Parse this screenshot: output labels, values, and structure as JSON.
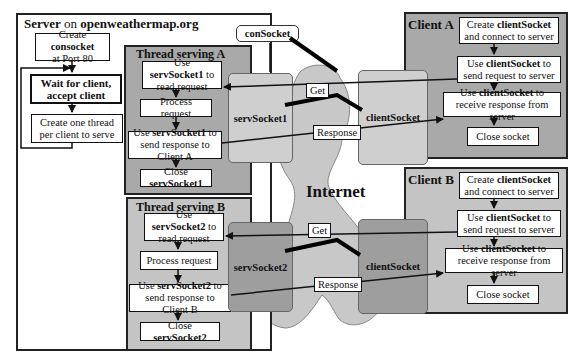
{
  "server": {
    "title_bold1": "Server",
    "title_normal": " on ",
    "title_bold2": "openweathermap.org",
    "steps": [
      {
        "pre": "Create ",
        "bold": "consocket",
        "post": " at Port 80"
      },
      {
        "text": "Wait for client, accept client"
      },
      {
        "text": "Create one thread per client to serve"
      }
    ]
  },
  "thread_a": {
    "title": "Thread serving A",
    "steps": [
      {
        "pre": "Use ",
        "bold": "servSocket1",
        "post": " to read request"
      },
      {
        "text": "Process request"
      },
      {
        "pre": "Use ",
        "bold": "servSocket1",
        "post": " to send response to Client A"
      },
      {
        "pre": "Close ",
        "bold": "servSocket1",
        "post": ""
      }
    ]
  },
  "thread_b": {
    "title": "Thread serving B",
    "steps": [
      {
        "pre": "Use ",
        "bold": "servSocket2",
        "post": " to read request"
      },
      {
        "text": "Process request"
      },
      {
        "pre": "Use ",
        "bold": "servSocket2",
        "post": " to send response to Client B"
      },
      {
        "pre": "Close ",
        "bold": "servSocket2",
        "post": ""
      }
    ]
  },
  "client_a": {
    "title": "Client A",
    "steps": [
      {
        "pre": "Create ",
        "bold": "clientSocket",
        "post": " and connect to server"
      },
      {
        "pre": "Use ",
        "bold": "clientSocket",
        "post": " to send request to server"
      },
      {
        "pre": "Use ",
        "bold": "clientSocket",
        "post": " to receive response from server"
      },
      {
        "text": "Close socket"
      }
    ]
  },
  "client_b": {
    "title": "Client B",
    "steps": [
      {
        "pre": "Create ",
        "bold": "clientSocket",
        "post": " and connect to server"
      },
      {
        "pre": "Use ",
        "bold": "clientSocket",
        "post": " to send request to server"
      },
      {
        "pre": "Use ",
        "bold": "clientSocket",
        "post": " to receive response from server"
      },
      {
        "text": "Close socket"
      }
    ]
  },
  "sockets": {
    "consocket": "conSocket",
    "serv1": "servSocket1",
    "serv2": "servSocket2",
    "client1": "clientSocket",
    "client2": "clientSocket"
  },
  "labels": {
    "get": "Get",
    "response": "Response",
    "internet": "Internet"
  },
  "colors": {
    "thread_panel": "#a9a9a9",
    "client_panel": "#c4c4c4",
    "cloud": "#c8c8c8",
    "socket_light": "#cfcfcf",
    "socket_dark": "#9e9e9e"
  }
}
